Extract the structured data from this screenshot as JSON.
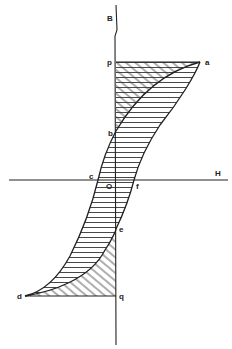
{
  "diagram": {
    "type": "hysteresis-loop",
    "axes": {
      "vertical_label": "B",
      "horizontal_label": "H",
      "origin_label": "O"
    },
    "points": {
      "a": "a",
      "b": "b",
      "c": "c",
      "d": "d",
      "e": "e",
      "f": "f",
      "p": "p",
      "q": "q"
    },
    "regions": [
      {
        "name": "upper-crosshatched",
        "bounds": "p-a-b",
        "fill": "diagonal-hatch"
      },
      {
        "name": "loop-interior",
        "bounds": "a-b-c-d-e-f",
        "fill": "horizontal-hatch"
      },
      {
        "name": "lower-crosshatched",
        "bounds": "e-d-q",
        "fill": "diagonal-hatch"
      }
    ],
    "colors": {
      "ink": "#222222",
      "background": "#ffffff"
    }
  }
}
